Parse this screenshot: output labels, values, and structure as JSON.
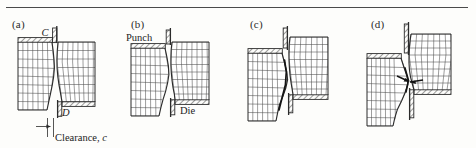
{
  "figure": {
    "title_rule": true,
    "background_color": "#fdfdfb",
    "line_color": "#2b2b2b",
    "grid_color": "#4d4d4d",
    "hatch_color": "#3a3a3a"
  },
  "panels": [
    {
      "id": "a",
      "label": "(a)",
      "annotations": [
        {
          "name": "point-c",
          "text": "C",
          "italic": true
        },
        {
          "name": "point-d",
          "text": "D",
          "italic": true
        },
        {
          "name": "clearance-label",
          "text": "Clearance, c",
          "italic": false
        }
      ]
    },
    {
      "id": "b",
      "label": "(b)",
      "annotations": [
        {
          "name": "punch-label",
          "text": "Punch",
          "italic": false
        },
        {
          "name": "die-label",
          "text": "Die",
          "italic": false
        }
      ]
    },
    {
      "id": "c",
      "label": "(c)",
      "annotations": []
    },
    {
      "id": "d",
      "label": "(d)",
      "annotations": []
    }
  ],
  "labels": {
    "a": "(a)",
    "b": "(b)",
    "c": "(c)",
    "d": "(d)",
    "point_c": "C",
    "point_d": "D",
    "clearance": "Clearance, c",
    "clearance_text": "Clearance, ",
    "clearance_sym": "c",
    "punch": "Punch",
    "die": "Die"
  }
}
